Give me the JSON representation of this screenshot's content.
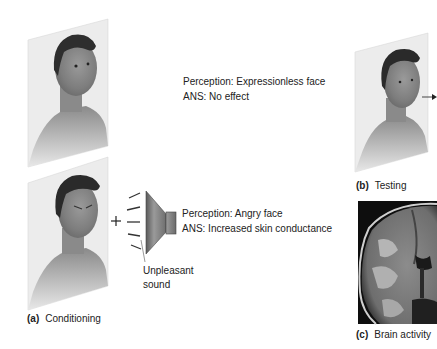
{
  "figure": {
    "panel_a": {
      "label": "(a)",
      "caption": "Conditioning",
      "top_row": {
        "perception": "Perception: Expressionless face",
        "ans": "ANS: No effect"
      },
      "bottom_row": {
        "plus_sign": "+",
        "perception": "Perception: Angry face",
        "ans": "ANS: Increased skin conductance",
        "sound_label_line1": "Unpleasant",
        "sound_label_line2": "sound"
      }
    },
    "panel_b": {
      "label": "(b)",
      "caption": "Testing"
    },
    "panel_c": {
      "label": "(c)",
      "caption": "Brain activity"
    }
  }
}
